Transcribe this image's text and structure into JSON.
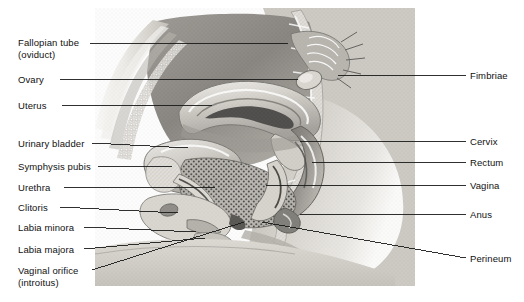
{
  "figure": {
    "background_color": "#ffffff",
    "text_color": "#111111",
    "leader_color": "#1a1a1a",
    "width": 524,
    "height": 302
  },
  "illustration": {
    "name": "female-pelvis-sagittal-illustration",
    "style": "grayscale halftone anatomical drawing",
    "palette": {
      "skin_light": "#e8e6e2",
      "skin_mid": "#cfccc6",
      "tissue_mid": "#a8a5a0",
      "tissue_dark": "#6e6c68",
      "tissue_darkest": "#3f3e3c",
      "highlight": "#f4f3f0",
      "bone": "#dedbd5"
    }
  },
  "labels_left": [
    {
      "id": "fallopian-tube",
      "line1": "Fallopian tube",
      "line2": "(oviduct)",
      "x": 18,
      "y": 37,
      "leader": {
        "x1": 90,
        "y1": 43,
        "x2": 288,
        "y2": 43
      }
    },
    {
      "id": "ovary",
      "line1": "Ovary",
      "line2": "",
      "x": 18,
      "y": 74,
      "leader": {
        "x1": 60,
        "y1": 79,
        "x2": 298,
        "y2": 79
      }
    },
    {
      "id": "uterus",
      "line1": "Uterus",
      "line2": "",
      "x": 18,
      "y": 100,
      "leader": {
        "x1": 62,
        "y1": 105,
        "x2": 212,
        "y2": 105
      }
    },
    {
      "id": "urinary-bladder",
      "line1": "Urinary bladder",
      "line2": "",
      "x": 18,
      "y": 138,
      "leader": {
        "x1": 92,
        "y1": 143,
        "x2": 188,
        "y2": 148
      }
    },
    {
      "id": "symphysis-pubis",
      "line1": "Symphysis pubis",
      "line2": "",
      "x": 18,
      "y": 161,
      "leader": {
        "x1": 98,
        "y1": 166,
        "x2": 172,
        "y2": 166
      }
    },
    {
      "id": "urethra",
      "line1": "Urethra",
      "line2": "",
      "x": 18,
      "y": 182,
      "leader": {
        "x1": 64,
        "y1": 187,
        "x2": 215,
        "y2": 187
      }
    },
    {
      "id": "clitoris",
      "line1": "Clitoris",
      "line2": "",
      "x": 18,
      "y": 202,
      "leader": {
        "x1": 60,
        "y1": 207,
        "x2": 178,
        "y2": 213
      }
    },
    {
      "id": "labia-minora",
      "line1": "Labia minora",
      "line2": "",
      "x": 18,
      "y": 222,
      "leader": {
        "x1": 84,
        "y1": 227,
        "x2": 196,
        "y2": 232
      }
    },
    {
      "id": "labia-majora",
      "line1": "Labia majora",
      "line2": "",
      "x": 18,
      "y": 244,
      "leader": {
        "x1": 84,
        "y1": 249,
        "x2": 205,
        "y2": 238
      }
    },
    {
      "id": "vaginal-orifice",
      "line1": "Vaginal orifice",
      "line2": "(introitus)",
      "x": 18,
      "y": 265,
      "leader": {
        "x1": 92,
        "y1": 270,
        "x2": 244,
        "y2": 222
      }
    }
  ],
  "labels_right": [
    {
      "id": "fimbriae",
      "line1": "Fimbriae",
      "line2": "",
      "x": 470,
      "y": 70,
      "leader": {
        "x1": 338,
        "y1": 75,
        "x2": 466,
        "y2": 75
      }
    },
    {
      "id": "cervix",
      "line1": "Cervix",
      "line2": "",
      "x": 470,
      "y": 136,
      "leader": {
        "x1": 300,
        "y1": 141,
        "x2": 466,
        "y2": 141
      }
    },
    {
      "id": "rectum",
      "line1": "Rectum",
      "line2": "",
      "x": 470,
      "y": 157,
      "leader": {
        "x1": 312,
        "y1": 162,
        "x2": 466,
        "y2": 162
      }
    },
    {
      "id": "vagina",
      "line1": "Vagina",
      "line2": "",
      "x": 470,
      "y": 180,
      "leader": {
        "x1": 266,
        "y1": 185,
        "x2": 466,
        "y2": 185
      }
    },
    {
      "id": "anus",
      "line1": "Anus",
      "line2": "",
      "x": 470,
      "y": 209,
      "leader": {
        "x1": 300,
        "y1": 214,
        "x2": 466,
        "y2": 214
      }
    },
    {
      "id": "perineum",
      "line1": "Perineum",
      "line2": "",
      "x": 470,
      "y": 253,
      "leader": {
        "x1": 262,
        "y1": 222,
        "x2": 466,
        "y2": 258
      }
    }
  ]
}
